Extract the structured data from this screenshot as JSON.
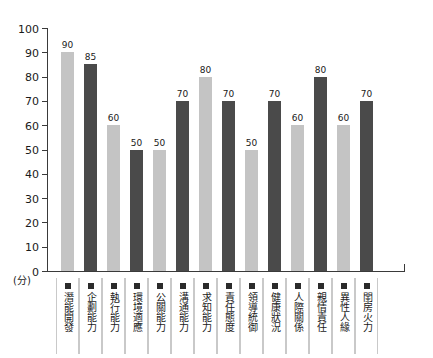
{
  "chart_data": {
    "type": "bar",
    "title": "",
    "xlabel": "",
    "ylabel": "(分)",
    "ylim": [
      0,
      100
    ],
    "ytick_step": 10,
    "yticks": [
      100,
      90,
      80,
      70,
      60,
      50,
      40,
      30,
      20,
      10,
      0
    ],
    "grid": false,
    "legend": "none",
    "categories": [
      "潛能開發",
      "企劃能力",
      "執行能力",
      "環境適應",
      "公關能力",
      "溝通能力",
      "求知能力",
      "責任態度",
      "領導統御",
      "健康狀況",
      "人際關係",
      "親情責任",
      "異性人緣",
      "閨房火力"
    ],
    "values": [
      90,
      85,
      60,
      50,
      50,
      70,
      80,
      70,
      50,
      70,
      60,
      80,
      60,
      70
    ],
    "bar_colors": [
      "#c4c4c4",
      "#4a4a4a",
      "#c4c4c4",
      "#4a4a4a",
      "#c4c4c4",
      "#4a4a4a",
      "#c4c4c4",
      "#4a4a4a",
      "#c4c4c4",
      "#4a4a4a",
      "#c4c4c4",
      "#4a4a4a",
      "#c4c4c4",
      "#4a4a4a"
    ],
    "colors": {
      "light_bar": "#c4c4c4",
      "dark_bar": "#4a4a4a",
      "axis": "#3a3a3a",
      "text": "#1a1a1a",
      "cell_divider": "#c9c9c9",
      "marker": "#2b2b2b",
      "background": "#ffffff"
    },
    "unit_label": "(分)"
  }
}
